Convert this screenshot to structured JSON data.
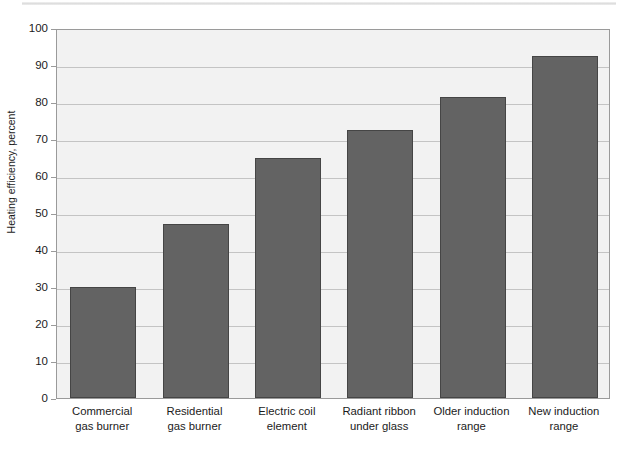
{
  "chart_data": {
    "type": "bar",
    "title": "",
    "subtitle": "",
    "xlabel": "",
    "ylabel": "Heating efficiency, percent",
    "ylim": [
      0,
      100
    ],
    "yticks": [
      0,
      10,
      20,
      30,
      40,
      50,
      60,
      70,
      80,
      90,
      100
    ],
    "ytick_labels": [
      "0",
      "10",
      "20",
      "30",
      "40",
      "50",
      "60",
      "70",
      "80",
      "90",
      "100"
    ],
    "grid": true,
    "legend": "none",
    "categories": [
      "Commercial gas burner",
      "Residential gas burner",
      "Electric coil element",
      "Radiant ribbon under glass",
      "Older induction range",
      "New induction range"
    ],
    "category_lines": [
      [
        "Commercial",
        "gas burner"
      ],
      [
        "Residential",
        "gas burner"
      ],
      [
        "Electric coil",
        "element"
      ],
      [
        "Radiant ribbon",
        "under glass"
      ],
      [
        "Older induction",
        "range"
      ],
      [
        "New induction",
        "range"
      ]
    ],
    "values": [
      30,
      47,
      65,
      72.5,
      81.5,
      92.5
    ],
    "bar_color": "#636363",
    "bar_edge_color": "#454545",
    "plot_background": "#f2f2f2",
    "gridline_color": "#c4c4c4",
    "axis_color": "#9a9a9a",
    "text_color": "#1b1b1b"
  }
}
